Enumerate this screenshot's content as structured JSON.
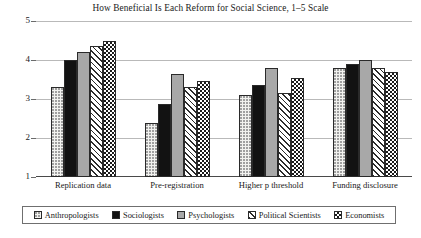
{
  "chart_data": {
    "type": "bar",
    "title": "How Beneficial Is Each Reform for Social Science, 1–5 Scale",
    "xlabel": "",
    "ylabel": "",
    "ylim": [
      1,
      5
    ],
    "yticks": [
      1,
      2,
      3,
      4,
      5
    ],
    "ytick_labels": [
      "1",
      "2",
      "3",
      "4",
      "5"
    ],
    "grid": true,
    "legend_position": "bottom",
    "categories": [
      "Replication data",
      "Pre-registration",
      "Higher p threshold",
      "Funding disclosure"
    ],
    "series": [
      {
        "name": "Anthropologists",
        "fill": "dotted",
        "values": [
          3.3,
          2.38,
          3.1,
          3.8
        ]
      },
      {
        "name": "Sociologists",
        "fill": "solid-black",
        "values": [
          4.0,
          2.88,
          3.35,
          3.9
        ]
      },
      {
        "name": "Psychologists",
        "fill": "solid-gray",
        "values": [
          4.2,
          3.65,
          3.8,
          4.0
        ]
      },
      {
        "name": "Political Scientists",
        "fill": "diagonal-hatch",
        "values": [
          4.35,
          3.3,
          3.15,
          3.8
        ]
      },
      {
        "name": "Economists",
        "fill": "checkerboard",
        "values": [
          4.5,
          3.45,
          3.55,
          3.7
        ]
      }
    ]
  },
  "legend": {
    "items": [
      {
        "label": "Anthropologists"
      },
      {
        "label": "Sociologists"
      },
      {
        "label": "Psychologists"
      },
      {
        "label": "Political Scientists"
      },
      {
        "label": "Economists"
      }
    ]
  },
  "colors": {
    "gridline": "#b9b9b9",
    "axis": "#4a4a4a",
    "text": "#1a1a1a",
    "series_black": "#121212",
    "series_gray": "#a8a8a8",
    "series_light": "#f2f2ef"
  }
}
